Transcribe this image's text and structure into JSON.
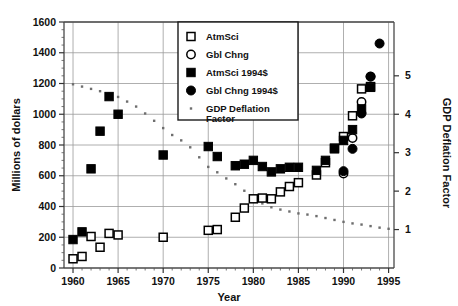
{
  "chart_data": {
    "type": "scatter",
    "title": "",
    "xlabel": "Year",
    "ylabel": "Millions of dollars",
    "y2label": "GDP Deflation Factor",
    "xlim": [
      1959,
      1995.6
    ],
    "ylim": [
      0,
      1600
    ],
    "y2lim": [
      0,
      6.4
    ],
    "xticks": [
      1960,
      1965,
      1970,
      1975,
      1980,
      1985,
      1990,
      1995
    ],
    "xticklabels": [
      "1960",
      "1965",
      "1970",
      "1975",
      "1980",
      "1985",
      "1990",
      "1995"
    ],
    "yticks": [
      0,
      200,
      400,
      600,
      800,
      1000,
      1200,
      1400,
      1600
    ],
    "yticklabels": [
      "0",
      "200",
      "400",
      "600",
      "800",
      "1000",
      "1200",
      "1400",
      "1600"
    ],
    "y2ticks": [
      1,
      2,
      3,
      4,
      5
    ],
    "y2ticklabels": [
      "1",
      "2",
      "3",
      "4",
      "5"
    ],
    "grid": true,
    "legend_position": "top-center",
    "series": [
      {
        "name": "AtmSci",
        "marker": "open-square",
        "color": "#000000",
        "axis": "left",
        "points": [
          [
            1960,
            60
          ],
          [
            1961,
            75
          ],
          [
            1962,
            205
          ],
          [
            1963,
            135
          ],
          [
            1964,
            225
          ],
          [
            1965,
            215
          ],
          [
            1970,
            200
          ],
          [
            1975,
            245
          ],
          [
            1976,
            250
          ],
          [
            1978,
            330
          ],
          [
            1979,
            390
          ],
          [
            1980,
            450
          ],
          [
            1981,
            455
          ],
          [
            1982,
            450
          ],
          [
            1983,
            495
          ],
          [
            1984,
            530
          ],
          [
            1985,
            555
          ],
          [
            1987,
            605
          ],
          [
            1988,
            685
          ],
          [
            1989,
            780
          ],
          [
            1990,
            855
          ],
          [
            1991,
            990
          ],
          [
            1992,
            1165
          ],
          [
            1993,
            1180
          ]
        ]
      },
      {
        "name": "Gbl Chng",
        "marker": "open-circle",
        "color": "#000000",
        "axis": "left",
        "points": [
          [
            1990,
            615
          ],
          [
            1991,
            845
          ],
          [
            1992,
            1080
          ],
          [
            1993,
            1245
          ]
        ]
      },
      {
        "name": "AtmSci 1994$",
        "marker": "filled-square",
        "color": "#000000",
        "axis": "left",
        "points": [
          [
            1960,
            185
          ],
          [
            1961,
            235
          ],
          [
            1962,
            645
          ],
          [
            1963,
            890
          ],
          [
            1964,
            1115
          ],
          [
            1965,
            1000
          ],
          [
            1970,
            735
          ],
          [
            1975,
            790
          ],
          [
            1976,
            725
          ],
          [
            1978,
            665
          ],
          [
            1979,
            675
          ],
          [
            1980,
            700
          ],
          [
            1981,
            660
          ],
          [
            1982,
            625
          ],
          [
            1983,
            645
          ],
          [
            1984,
            655
          ],
          [
            1985,
            655
          ],
          [
            1987,
            635
          ],
          [
            1988,
            700
          ],
          [
            1989,
            775
          ],
          [
            1990,
            830
          ],
          [
            1991,
            900
          ],
          [
            1992,
            1035
          ],
          [
            1993,
            1175
          ]
        ]
      },
      {
        "name": "Gbl Chng 1994$",
        "marker": "filled-circle",
        "color": "#000000",
        "axis": "left",
        "points": [
          [
            1990,
            630
          ],
          [
            1991,
            775
          ],
          [
            1992,
            1005
          ],
          [
            1993,
            1245
          ],
          [
            1994,
            1460
          ]
        ]
      },
      {
        "name": "GDP Deflation Factor",
        "marker": "small-dot",
        "color": "#6e6e6e",
        "axis": "right",
        "points": [
          [
            1960,
            4.78
          ],
          [
            1961,
            4.72
          ],
          [
            1962,
            4.66
          ],
          [
            1963,
            4.6
          ],
          [
            1964,
            4.54
          ],
          [
            1965,
            4.45
          ],
          [
            1966,
            4.33
          ],
          [
            1967,
            4.2
          ],
          [
            1968,
            4.02
          ],
          [
            1969,
            3.83
          ],
          [
            1970,
            3.64
          ],
          [
            1971,
            3.46
          ],
          [
            1972,
            3.32
          ],
          [
            1973,
            3.14
          ],
          [
            1974,
            2.88
          ],
          [
            1975,
            2.63
          ],
          [
            1976,
            2.49
          ],
          [
            1977,
            2.33
          ],
          [
            1978,
            2.18
          ],
          [
            1979,
            2.01
          ],
          [
            1980,
            1.84
          ],
          [
            1981,
            1.68
          ],
          [
            1982,
            1.58
          ],
          [
            1983,
            1.52
          ],
          [
            1984,
            1.47
          ],
          [
            1985,
            1.42
          ],
          [
            1986,
            1.39
          ],
          [
            1987,
            1.35
          ],
          [
            1988,
            1.3
          ],
          [
            1989,
            1.25
          ],
          [
            1990,
            1.2
          ],
          [
            1991,
            1.16
          ],
          [
            1992,
            1.13
          ],
          [
            1993,
            1.09
          ],
          [
            1994,
            1.05
          ],
          [
            1995,
            1.02
          ]
        ]
      }
    ],
    "legend": [
      {
        "label": "AtmSci",
        "marker": "open-square"
      },
      {
        "label": "Gbl Chng",
        "marker": "open-circle"
      },
      {
        "label": "AtmSci 1994$",
        "marker": "filled-square"
      },
      {
        "label": "Gbl Chng 1994$",
        "marker": "filled-circle"
      },
      {
        "label": "GDP Deflation",
        "label2": "Factor",
        "marker": "small-dot"
      }
    ]
  }
}
